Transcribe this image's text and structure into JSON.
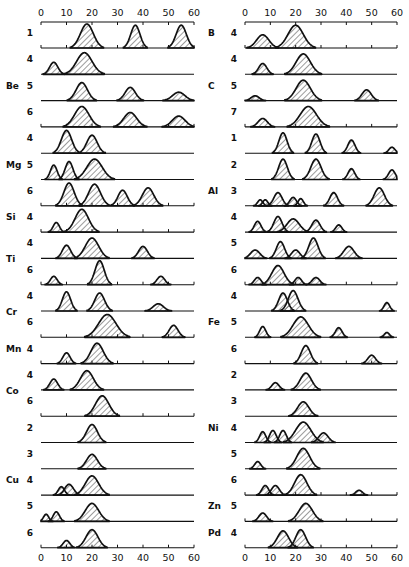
{
  "chart_data": {
    "type": "area",
    "title": "",
    "xlabel": "",
    "ylabel": "",
    "xlim": [
      0,
      60
    ],
    "xticks": [
      0,
      10,
      20,
      30,
      40,
      50,
      60
    ],
    "grid": false,
    "legend": null,
    "panels": [
      {
        "name": "left",
        "rows": [
          {
            "element": "Be",
            "cn": "1",
            "peaks": [
              [
                18,
                1.0,
                2.5
              ],
              [
                37,
                0.95,
                1.8
              ],
              [
                55,
                0.95,
                2.0
              ]
            ]
          },
          {
            "element": "Be",
            "cn": "4",
            "peaks": [
              [
                5,
                0.5,
                1.6
              ],
              [
                17,
                0.9,
                3.0
              ]
            ]
          },
          {
            "element": "",
            "cn": "5",
            "peaks": [
              [
                16,
                0.75,
                2.2
              ],
              [
                35,
                0.55,
                2.0
              ],
              [
                54,
                0.35,
                2.4
              ]
            ]
          },
          {
            "element": "",
            "cn": "6",
            "peaks": [
              [
                16,
                0.85,
                2.8
              ],
              [
                35,
                0.6,
                2.5
              ],
              [
                54,
                0.45,
                2.5
              ]
            ]
          },
          {
            "element": "",
            "cn": "4",
            "peaks": [
              [
                10,
                0.95,
                2.0
              ],
              [
                20,
                0.75,
                2.0
              ]
            ]
          },
          {
            "element": "Mg",
            "cn": "5",
            "peaks": [
              [
                5,
                0.6,
                1.3
              ],
              [
                11,
                0.75,
                1.5
              ],
              [
                21,
                0.85,
                3.0
              ]
            ]
          },
          {
            "element": "",
            "cn": "6",
            "peaks": [
              [
                11,
                0.95,
                2.0
              ],
              [
                21,
                0.9,
                2.3
              ],
              [
                32,
                0.65,
                1.8
              ],
              [
                42,
                0.75,
                2.2
              ]
            ]
          },
          {
            "element": "Si",
            "cn": "4",
            "peaks": [
              [
                6,
                0.4,
                1.2
              ],
              [
                16,
                0.95,
                2.6
              ]
            ]
          },
          {
            "element": "Ti",
            "cn": "4",
            "peaks": [
              [
                10,
                0.55,
                1.6
              ],
              [
                20,
                0.85,
                2.6
              ],
              [
                40,
                0.5,
                1.7
              ]
            ]
          },
          {
            "element": "",
            "cn": "6",
            "peaks": [
              [
                5,
                0.35,
                1.3
              ],
              [
                23,
                1.0,
                1.8
              ],
              [
                47,
                0.35,
                1.5
              ]
            ]
          },
          {
            "element": "Cr",
            "cn": "4",
            "peaks": [
              [
                10,
                0.8,
                1.6
              ],
              [
                23,
                0.75,
                1.9
              ],
              [
                46,
                0.3,
                2.0
              ]
            ]
          },
          {
            "element": "",
            "cn": "6",
            "peaks": [
              [
                26,
                0.95,
                3.4
              ],
              [
                52,
                0.5,
                1.7
              ]
            ]
          },
          {
            "element": "Mn",
            "cn": "4",
            "peaks": [
              [
                10,
                0.45,
                1.4
              ],
              [
                22,
                0.85,
                2.4
              ]
            ]
          },
          {
            "element": "Co",
            "cn": "4",
            "peaks": [
              [
                5,
                0.45,
                1.5
              ],
              [
                18,
                0.8,
                2.5
              ]
            ]
          },
          {
            "element": "",
            "cn": "6",
            "peaks": [
              [
                24,
                0.85,
                2.6
              ]
            ]
          },
          {
            "element": "",
            "cn": "2",
            "peaks": [
              [
                20,
                0.75,
                2.1
              ]
            ]
          },
          {
            "element": "",
            "cn": "3",
            "peaks": [
              [
                20,
                0.6,
                2.1
              ]
            ]
          },
          {
            "element": "Cu",
            "cn": "4",
            "peaks": [
              [
                8,
                0.35,
                1.2
              ],
              [
                11,
                0.45,
                1.7
              ],
              [
                20,
                0.8,
                2.6
              ]
            ]
          },
          {
            "element": "",
            "cn": "5",
            "peaks": [
              [
                2,
                0.3,
                1.0
              ],
              [
                6,
                0.4,
                1.2
              ],
              [
                20,
                0.75,
                2.6
              ]
            ]
          },
          {
            "element": "",
            "cn": "6",
            "peaks": [
              [
                10,
                0.3,
                1.3
              ],
              [
                20,
                0.75,
                2.3
              ]
            ]
          }
        ]
      },
      {
        "name": "right",
        "rows": [
          {
            "element": "B",
            "cn": "4",
            "peaks": [
              [
                7,
                0.55,
                2.4
              ],
              [
                20,
                0.95,
                3.0
              ]
            ]
          },
          {
            "element": "",
            "cn": "4",
            "peaks": [
              [
                7,
                0.45,
                1.6
              ],
              [
                23,
                0.85,
                2.8
              ]
            ]
          },
          {
            "element": "C",
            "cn": "5",
            "peaks": [
              [
                4,
                0.2,
                1.6
              ],
              [
                23,
                0.85,
                2.8
              ],
              [
                48,
                0.45,
                1.8
              ]
            ]
          },
          {
            "element": "",
            "cn": "7",
            "peaks": [
              [
                7,
                0.35,
                1.8
              ],
              [
                25,
                0.85,
                3.2
              ]
            ]
          },
          {
            "element": "",
            "cn": "1",
            "peaks": [
              [
                15,
                0.85,
                1.6
              ],
              [
                28,
                0.8,
                1.6
              ],
              [
                42,
                0.55,
                1.4
              ],
              [
                58,
                0.25,
                1.2
              ]
            ]
          },
          {
            "element": "",
            "cn": "2",
            "peaks": [
              [
                15,
                0.85,
                1.7
              ],
              [
                28,
                0.85,
                2.0
              ],
              [
                42,
                0.45,
                1.3
              ],
              [
                58,
                0.4,
                1.3
              ]
            ]
          },
          {
            "element": "Al",
            "cn": "3",
            "peaks": [
              [
                6,
                0.25,
                1.0
              ],
              [
                8,
                0.25,
                1.0
              ],
              [
                13,
                0.55,
                1.6
              ],
              [
                19,
                0.35,
                1.3
              ],
              [
                22,
                0.3,
                1.0
              ],
              [
                35,
                0.55,
                1.5
              ],
              [
                53,
                0.75,
                2.0
              ]
            ]
          },
          {
            "element": "",
            "cn": "4",
            "peaks": [
              [
                5,
                0.45,
                1.3
              ],
              [
                13,
                0.65,
                1.6
              ],
              [
                19,
                0.55,
                2.4
              ],
              [
                28,
                0.5,
                1.6
              ],
              [
                37,
                0.3,
                1.2
              ]
            ]
          },
          {
            "element": "",
            "cn": "5",
            "peaks": [
              [
                4,
                0.35,
                1.8
              ],
              [
                14,
                0.7,
                1.6
              ],
              [
                20,
                0.35,
                1.6
              ],
              [
                27,
                0.85,
                1.8
              ],
              [
                41,
                0.5,
                2.0
              ]
            ]
          },
          {
            "element": "",
            "cn": "6",
            "peaks": [
              [
                5,
                0.3,
                1.3
              ],
              [
                13,
                0.8,
                2.4
              ],
              [
                21,
                0.3,
                1.3
              ],
              [
                28,
                0.3,
                1.5
              ]
            ]
          },
          {
            "element": "",
            "cn": "4",
            "peaks": [
              [
                15,
                0.75,
                1.7
              ],
              [
                19,
                0.85,
                1.9
              ],
              [
                56,
                0.35,
                1.1
              ]
            ]
          },
          {
            "element": "Fe",
            "cn": "5",
            "peaks": [
              [
                7,
                0.45,
                1.2
              ],
              [
                22,
                0.85,
                3.0
              ],
              [
                37,
                0.4,
                1.3
              ],
              [
                56,
                0.2,
                1.0
              ]
            ]
          },
          {
            "element": "",
            "cn": "6",
            "peaks": [
              [
                24,
                0.75,
                1.8
              ],
              [
                50,
                0.35,
                1.5
              ]
            ]
          },
          {
            "element": "",
            "cn": "2",
            "peaks": [
              [
                12,
                0.3,
                1.4
              ],
              [
                24,
                0.7,
                2.2
              ]
            ]
          },
          {
            "element": "",
            "cn": "3",
            "peaks": [
              [
                23,
                0.6,
                2.2
              ]
            ]
          },
          {
            "element": "Ni",
            "cn": "4",
            "peaks": [
              [
                7,
                0.45,
                1.2
              ],
              [
                11,
                0.5,
                1.3
              ],
              [
                15,
                0.5,
                1.3
              ],
              [
                23,
                0.85,
                3.0
              ],
              [
                31,
                0.4,
                1.8
              ]
            ]
          },
          {
            "element": "",
            "cn": "5",
            "peaks": [
              [
                5,
                0.3,
                1.2
              ],
              [
                23,
                0.85,
                2.5
              ]
            ]
          },
          {
            "element": "",
            "cn": "6",
            "peaks": [
              [
                8,
                0.4,
                1.3
              ],
              [
                12,
                0.4,
                1.5
              ],
              [
                22,
                0.85,
                2.4
              ],
              [
                45,
                0.2,
                1.3
              ]
            ]
          },
          {
            "element": "Zn",
            "cn": "5",
            "peaks": [
              [
                7,
                0.35,
                1.5
              ],
              [
                24,
                0.75,
                2.6
              ]
            ]
          },
          {
            "element": "Pd",
            "cn": "4",
            "peaks": [
              [
                15,
                0.7,
                2.2
              ],
              [
                22,
                0.75,
                1.9
              ]
            ]
          }
        ]
      }
    ],
    "element_labels": {
      "left": [
        {
          "label": "Be",
          "row": 2
        },
        {
          "label": "Mg",
          "row": 5
        },
        {
          "label": "Si",
          "row": 7
        },
        {
          "label": "Ti",
          "row": 8.6
        },
        {
          "label": "Cr",
          "row": 10.6
        },
        {
          "label": "Mn",
          "row": 12
        },
        {
          "label": "Co",
          "row": 13.6
        },
        {
          "label": "Cu",
          "row": 17
        }
      ],
      "right": [
        {
          "label": "B",
          "row": 0
        },
        {
          "label": "C",
          "row": 2
        },
        {
          "label": "Al",
          "row": 6
        },
        {
          "label": "Fe",
          "row": 11
        },
        {
          "label": "Ni",
          "row": 15
        },
        {
          "label": "Zn",
          "row": 18
        },
        {
          "label": "Pd",
          "row": 19
        }
      ]
    }
  },
  "layout": {
    "left": {
      "x0": 41,
      "x60": 194,
      "label_x": 18,
      "cn_x": 30,
      "elem_x": 6
    },
    "right": {
      "x0": 245,
      "x60": 397,
      "label_x": 225,
      "cn_x": 234,
      "elem_x": 208
    },
    "axis_top_y": 22,
    "first_baseline": 48,
    "row_spacing": 26.3,
    "peak_max_height": 24,
    "ticked_rows_left": [
      0,
      3,
      6,
      7,
      9,
      11,
      12,
      14,
      19
    ],
    "ticked_rows_right": [
      0,
      3,
      9,
      12,
      17,
      18,
      19
    ]
  }
}
